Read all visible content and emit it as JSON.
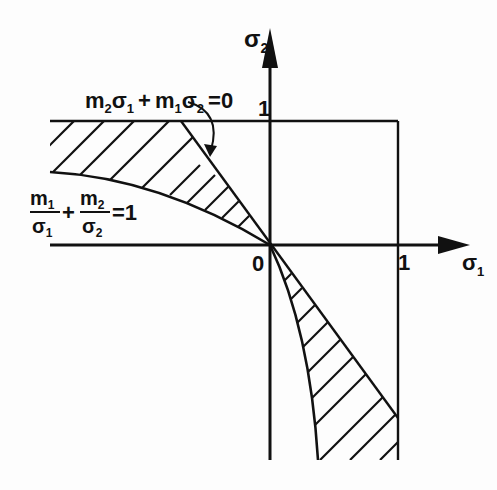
{
  "figure": {
    "axes": {
      "x_label": "σ",
      "x_sub": "1",
      "y_label": "σ",
      "y_sub": "2",
      "origin_label": "0",
      "x_tick": "1",
      "y_tick": "1"
    },
    "equations": {
      "line": {
        "a": "m",
        "a_sub": "2",
        "b": "σ",
        "b_sub": "1",
        "plus": "+",
        "c": "m",
        "c_sub": "1",
        "d": "σ",
        "d_sub": "2",
        "rhs": "=0"
      },
      "curve": {
        "n1": "m",
        "n1_sub": "1",
        "d1": "σ",
        "d1_sub": "1",
        "plus": "+",
        "n2": "m",
        "n2_sub": "2",
        "d2": "σ",
        "d2_sub": "2",
        "rhs": "=1"
      }
    },
    "colors": {
      "ink": "#111111",
      "background": "#fdfdfd"
    }
  }
}
